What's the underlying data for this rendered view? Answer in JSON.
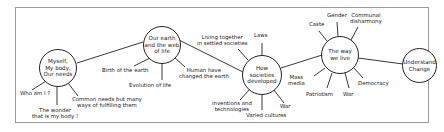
{
  "diagram": {
    "type": "mind-map",
    "nodes": [
      {
        "id": "myself",
        "label": "Myself, My body, Our needs",
        "lines": [
          "Myself,",
          "My body,",
          "Our needs"
        ]
      },
      {
        "id": "earth",
        "label": "Our earth and the web of life",
        "lines": [
          "Our earth",
          "and the web",
          "of life"
        ]
      },
      {
        "id": "societies",
        "label": "How societies developed",
        "lines": [
          "How societies",
          "developed"
        ]
      },
      {
        "id": "waywelive",
        "label": "The way we live",
        "lines": [
          "The way",
          "we live"
        ]
      },
      {
        "id": "change",
        "label": "Understand Change",
        "lines": [
          "Understand",
          "Change"
        ]
      }
    ],
    "branches": {
      "myself": [
        "Who am I ?",
        "The wonder that is my body !",
        "Common needs but many ways of fulfilling them"
      ],
      "earth": [
        "Birth of the earth",
        "Evolution of life",
        "Human have changed the earth"
      ],
      "societies": [
        "Living together in settled societies",
        "Laws",
        "Mass media",
        "War",
        "Varied cultures",
        "inventions and technologies"
      ],
      "waywelive": [
        "Caste",
        "Gender",
        "Communal disharmony",
        "Democracy",
        "War",
        "Patriotism"
      ]
    },
    "edges": [
      [
        "myself",
        "earth"
      ],
      [
        "earth",
        "societies"
      ],
      [
        "societies",
        "waywelive"
      ],
      [
        "waywelive",
        "change"
      ]
    ]
  },
  "labels": {
    "who": "Who am I ?",
    "wonder1": "The wonder",
    "wonder2": "that is my body !",
    "common1": "Common needs but many",
    "common2": "ways of fulfilling them",
    "birth": "Birth of the earth",
    "evolution": "Evolution of life",
    "human1": "Human have",
    "human2": "changed the earth",
    "living1": "Living together",
    "living2": "in settled societies",
    "laws": "Laws",
    "mass1": "Mass",
    "mass2": "media",
    "war1": "War",
    "varied": "Varied cultures",
    "inv1": "inventions and",
    "inv2": "technologies",
    "caste": "Caste",
    "gender": "Gender",
    "comm1": "Communal",
    "comm2": "disharmony",
    "democracy": "Democracy",
    "war2": "War",
    "patriotism": "Patriotism"
  },
  "colors": {
    "line": "#222222",
    "frame": "#9a9a9a",
    "background": "#ffffff"
  }
}
